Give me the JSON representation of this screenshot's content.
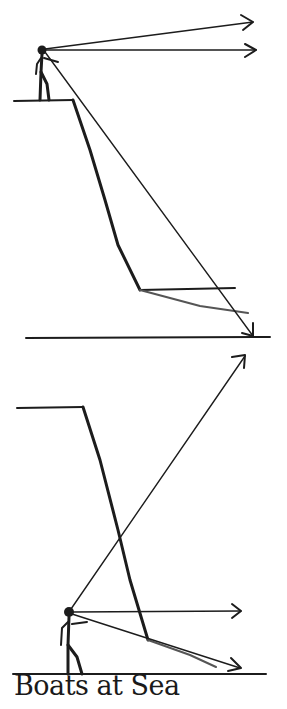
{
  "caption": "Boats at Sea",
  "colors": {
    "ink": "#1c1c1c",
    "background": "#ffffff"
  },
  "panels": [
    {
      "name": "observer-on-cliff",
      "description": "Stick figure standing on top of a cliff; sight lines drawn horizontal, slightly upward, and downward to the sea surface at the base of the cliff.",
      "elements": [
        "stick-figure",
        "cliff-top",
        "cliff-face",
        "sea-line",
        "horizontal-arrow",
        "upward-arrow",
        "downward-arrow",
        "reflected-ray"
      ]
    },
    {
      "name": "observer-at-sea-level",
      "description": "Stick figure standing at the base of a cliff at sea level; sight lines drawn upward past the cliff, horizontal, and slightly downward.",
      "elements": [
        "stick-figure",
        "cliff-top",
        "cliff-face",
        "sea-line",
        "horizontal-arrow",
        "upward-arrow",
        "downward-arrow"
      ]
    }
  ]
}
